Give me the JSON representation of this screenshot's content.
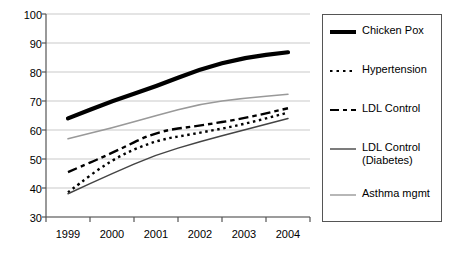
{
  "chart_data": {
    "type": "line",
    "title": "",
    "xlabel": "",
    "ylabel": "",
    "categories": [
      "1999",
      "2000",
      "2001",
      "2002",
      "2003",
      "2004"
    ],
    "ylim": [
      30,
      100
    ],
    "yticks": [
      30,
      40,
      50,
      60,
      70,
      80,
      90,
      100
    ],
    "grid": true,
    "legend_position": "right",
    "series": [
      {
        "name": "Chicken Pox",
        "style": "thick-solid",
        "color": "#000000",
        "values": [
          64,
          70,
          75,
          81,
          85,
          86.8
        ]
      },
      {
        "name": "Hypertension",
        "style": "dotted",
        "color": "#000000",
        "values": [
          38.5,
          50,
          56.5,
          59,
          62,
          66
        ]
      },
      {
        "name": "LDL Control",
        "style": "dashed",
        "color": "#000000",
        "values": [
          45.5,
          52,
          59.5,
          61.5,
          64,
          67.5
        ]
      },
      {
        "name": "LDL Control\n(Diabetes)",
        "style": "thin-solid",
        "color": "#444444",
        "values": [
          38,
          45,
          51.5,
          56,
          60,
          64
        ]
      },
      {
        "name": "Asthma mgmt",
        "style": "thin-solid-light",
        "color": "#999999",
        "values": [
          57,
          60.7,
          65,
          69,
          71,
          72.3
        ]
      }
    ]
  },
  "axis": {
    "y_tick_labels": [
      "100",
      "90",
      "80",
      "70",
      "60",
      "50",
      "40",
      "30"
    ],
    "x_tick_labels": [
      "1999",
      "2000",
      "2001",
      "2002",
      "2003",
      "2004"
    ]
  },
  "legend": {
    "items": [
      {
        "label": "Chicken Pox",
        "swatch": "thick-solid-swatch"
      },
      {
        "label": "Hypertension",
        "swatch": "dotted-swatch"
      },
      {
        "label": "LDL Control",
        "swatch": "dashed-swatch"
      },
      {
        "label": "LDL Control\n(Diabetes)",
        "swatch": "thin-solid-swatch"
      },
      {
        "label": "Asthma mgmt",
        "swatch": "light-solid-swatch"
      }
    ]
  }
}
